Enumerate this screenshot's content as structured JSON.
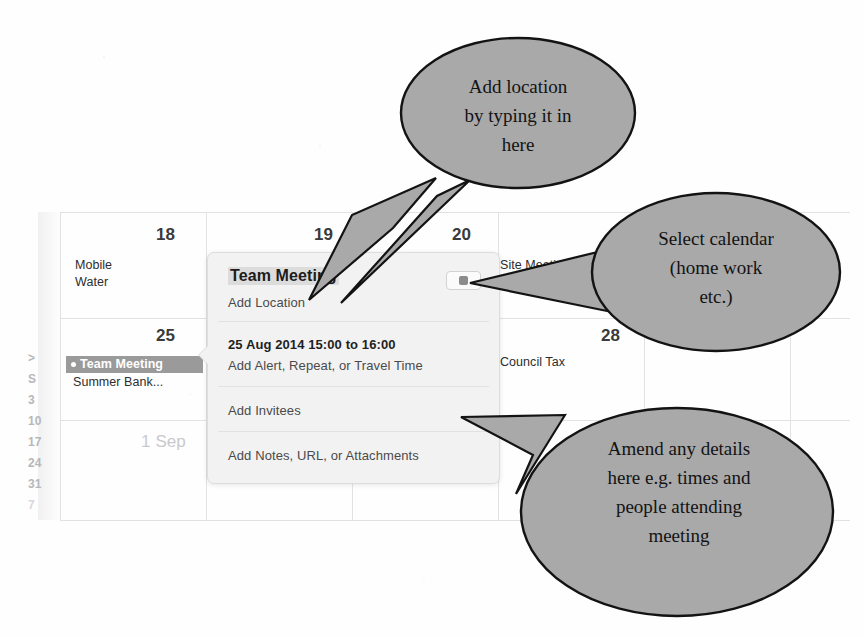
{
  "calendar": {
    "day_numbers": [
      {
        "value": "18",
        "x": 156,
        "y": 225,
        "muted": false
      },
      {
        "value": "19",
        "x": 314,
        "y": 225,
        "muted": false
      },
      {
        "value": "20",
        "x": 452,
        "y": 225,
        "muted": false
      },
      {
        "value": "25",
        "x": 156,
        "y": 326,
        "muted": false
      },
      {
        "value": "28",
        "x": 601,
        "y": 326,
        "muted": false
      },
      {
        "value": "1 Sep",
        "x": 141,
        "y": 432,
        "muted": true
      }
    ],
    "events": [
      {
        "label": "Mobile",
        "x": 75,
        "y": 258
      },
      {
        "label": "Water",
        "x": 75,
        "y": 275
      },
      {
        "label": "Site Meeting",
        "x": 500,
        "y": 258
      },
      {
        "label": "Council Tax",
        "x": 500,
        "y": 355
      },
      {
        "label": "Summer Bank...",
        "x": 73,
        "y": 375
      }
    ],
    "selected_event": {
      "label": "Team Meeting",
      "x": 66,
      "y": 356,
      "width": 126
    },
    "mini_column": [
      ">",
      "S",
      "3",
      "10",
      "17",
      "24",
      "31",
      "7"
    ],
    "grid_lines_v": [
      60,
      206,
      352,
      498,
      644,
      790
    ],
    "grid_lines_h": [
      212,
      318,
      420,
      520
    ]
  },
  "popover": {
    "title": "Team Meeting",
    "location_placeholder": "Add Location",
    "datetime": "25 Aug 2014 15:00 to 16:00",
    "alert_placeholder": "Add Alert, Repeat, or Travel Time",
    "invitees_placeholder": "Add Invitees",
    "notes_placeholder": "Add Notes, URL, or Attachments",
    "calendar_swatch_color": "#8c8c8c"
  },
  "callouts": [
    {
      "id": "location-callout",
      "lines": [
        "Add location",
        "by typing it in",
        "here"
      ]
    },
    {
      "id": "calendar-callout",
      "lines": [
        "Select calendar",
        "(home work",
        "etc.)"
      ]
    },
    {
      "id": "details-callout",
      "lines": [
        "Amend any details",
        "here e.g. times and",
        "people attending",
        "meeting"
      ]
    }
  ],
  "theme": {
    "callout_fill": "#a9a9a9",
    "callout_stroke": "#131313",
    "popover_bg": "#f2f2f2",
    "chip_bg": "#9a9a9a"
  }
}
